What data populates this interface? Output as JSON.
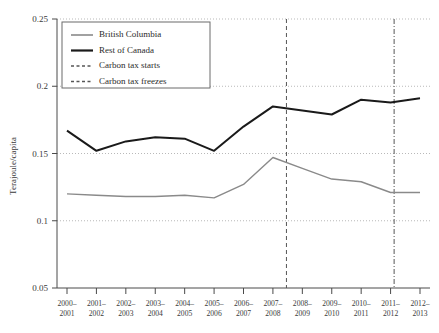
{
  "chart_data": {
    "type": "line",
    "title": "",
    "xlabel": "",
    "ylabel": "Terajoule/capita",
    "ylim": [
      0.05,
      0.25
    ],
    "yticks": [
      0.05,
      0.1,
      0.15,
      0.2,
      0.25
    ],
    "ytick_labels": [
      "0.05",
      "0.1",
      "0.15",
      "0.2",
      "0.25"
    ],
    "grid": true,
    "grid_axis": "y",
    "legend_position": "top-left",
    "categories": [
      "2000–2001",
      "2001–2002",
      "2002–2003",
      "2003–2004",
      "2004–2005",
      "2005–2006",
      "2006–2007",
      "2007–2008",
      "2008–2009",
      "2009–2010",
      "2010–2011",
      "2011–2012",
      "2012–2013"
    ],
    "xtick_labels_line1": [
      "2000–",
      "2001–",
      "2002–",
      "2003–",
      "2004–",
      "2005–",
      "2006–",
      "2007–",
      "2008–",
      "2009–",
      "2010–",
      "2011–",
      "2012–"
    ],
    "xtick_labels_line2": [
      "2001",
      "2002",
      "2003",
      "2004",
      "2005",
      "2006",
      "2007",
      "2008",
      "2009",
      "2010",
      "2011",
      "2012",
      "2013"
    ],
    "series": [
      {
        "name": "British Columbia",
        "color": "#8a8a8a",
        "width": 1.4,
        "values": [
          0.12,
          0.119,
          0.118,
          0.118,
          0.119,
          0.117,
          0.127,
          0.147,
          0.139,
          0.131,
          0.129,
          0.121,
          0.121
        ]
      },
      {
        "name": "Rest of Canada",
        "color": "#1a1a1a",
        "width": 2.0,
        "values": [
          0.167,
          0.152,
          0.159,
          0.162,
          0.161,
          0.152,
          0.17,
          0.185,
          0.182,
          0.179,
          0.19,
          0.188,
          0.191
        ]
      }
    ],
    "annotations": [
      {
        "label": "Carbon tax starts",
        "x_position": 7.46,
        "style": "dashed",
        "color": "#555555"
      },
      {
        "label": "Carbon tax freezes",
        "x_position": 11.12,
        "style": "dashdot",
        "color": "#555555"
      }
    ]
  },
  "legend": {
    "entries": [
      {
        "label": "British Columbia",
        "marker": "line-solid-grey"
      },
      {
        "label": "Rest of Canada",
        "marker": "line-solid-black"
      },
      {
        "label": "Carbon tax starts",
        "marker": "line-dashed"
      },
      {
        "label": "Carbon tax freezes",
        "marker": "line-dashdot"
      }
    ]
  }
}
